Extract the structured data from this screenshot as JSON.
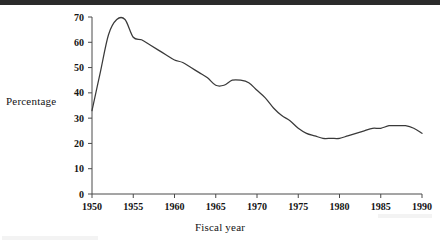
{
  "figure": {
    "scan_bar_color": "#2b2b2b",
    "background_color": "#ffffff",
    "line_color": "#3a3a3a",
    "axis_color": "#4a4a4a"
  },
  "chart_data": {
    "type": "line",
    "title": "",
    "xlabel": "Fiscal year",
    "ylabel": "Percentage",
    "xlim": [
      1950,
      1990
    ],
    "ylim": [
      0,
      70
    ],
    "grid": false,
    "legend": null,
    "xticks": [
      1950,
      1955,
      1960,
      1965,
      1970,
      1975,
      1980,
      1985,
      1990
    ],
    "xtick_labels": [
      "1950",
      "1955",
      "1960",
      "1965",
      "1970",
      "1975",
      "1980",
      "1985",
      "1990"
    ],
    "yticks": [
      0,
      10,
      20,
      30,
      40,
      50,
      60,
      70
    ],
    "ytick_labels": [
      "0",
      "10",
      "20",
      "30",
      "40",
      "50",
      "60",
      "70"
    ],
    "series": [
      {
        "name": "Percentage",
        "x": [
          1950,
          1951,
          1952,
          1953,
          1954,
          1955,
          1956,
          1957,
          1958,
          1959,
          1960,
          1961,
          1962,
          1963,
          1964,
          1965,
          1966,
          1967,
          1968,
          1969,
          1970,
          1971,
          1972,
          1973,
          1974,
          1975,
          1976,
          1977,
          1978,
          1979,
          1980,
          1981,
          1982,
          1983,
          1984,
          1985,
          1986,
          1987,
          1988,
          1989,
          1990
        ],
        "values": [
          33,
          48,
          63,
          69,
          69,
          62,
          61,
          59,
          57,
          55,
          53,
          52,
          50,
          48,
          46,
          43,
          43,
          45,
          45,
          44,
          41,
          38,
          34,
          31,
          29,
          26,
          24,
          23,
          22,
          22,
          22,
          23,
          24,
          25,
          26,
          26,
          27,
          27,
          27,
          26,
          24
        ]
      }
    ]
  }
}
